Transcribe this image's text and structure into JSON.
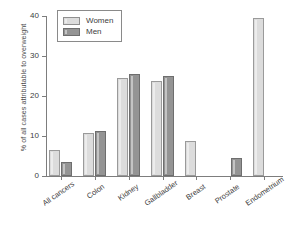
{
  "chart_data": {
    "type": "bar",
    "title": "",
    "xlabel": "",
    "ylabel": "% of all cases attributable to overweight",
    "ylim": [
      0,
      40
    ],
    "yticks": [
      0,
      10,
      20,
      30,
      40
    ],
    "grid": false,
    "legend_position": "top-left",
    "categories": [
      "All cancers",
      "Colon",
      "Kidney",
      "Gallbladder",
      "Breast",
      "Prostate",
      "Endometrium"
    ],
    "series": [
      {
        "name": "Women",
        "color": "#dcdcdc",
        "values": [
          6.4,
          10.8,
          24.5,
          23.8,
          8.7,
          0,
          39.5
        ]
      },
      {
        "name": "Men",
        "color": "#949494",
        "values": [
          3.5,
          11.2,
          25.5,
          24.9,
          0,
          4.6,
          0
        ]
      }
    ]
  },
  "legend": {
    "items": [
      {
        "label": "Women"
      },
      {
        "label": "Men"
      }
    ]
  }
}
